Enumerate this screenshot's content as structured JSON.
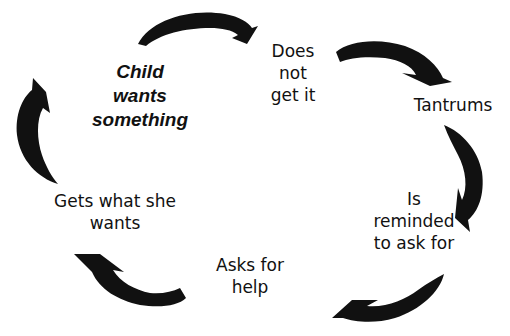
{
  "diagram": {
    "type": "cycle",
    "colors": {
      "arrow": "#111111",
      "text": "#111111",
      "background": "#ffffff"
    },
    "nodes": [
      {
        "id": "child-wants",
        "lines": [
          "Child",
          "wants",
          "something"
        ],
        "emphasis": "bold-italic"
      },
      {
        "id": "does-not-get",
        "lines": [
          "Does",
          "not",
          "get it"
        ]
      },
      {
        "id": "tantrums",
        "lines": [
          "Tantrums"
        ]
      },
      {
        "id": "is-reminded",
        "lines": [
          "Is",
          "reminded",
          "to ask for"
        ]
      },
      {
        "id": "asks-for-help",
        "lines": [
          "Asks for",
          "help"
        ]
      },
      {
        "id": "gets-what-she-wants",
        "lines": [
          "Gets what she",
          "wants"
        ]
      }
    ],
    "edges": [
      {
        "from": "child-wants",
        "to": "does-not-get"
      },
      {
        "from": "does-not-get",
        "to": "tantrums"
      },
      {
        "from": "tantrums",
        "to": "is-reminded"
      },
      {
        "from": "is-reminded",
        "to": "asks-for-help"
      },
      {
        "from": "asks-for-help",
        "to": "gets-what-she-wants"
      },
      {
        "from": "gets-what-she-wants",
        "to": "child-wants"
      }
    ]
  }
}
